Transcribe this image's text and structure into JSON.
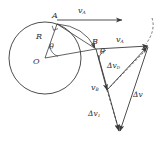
{
  "figure": {
    "stroke_color": "#3a3a3a",
    "label_color": "#2b2b2b",
    "background": "#ffffff"
  },
  "geometry": {
    "circle": {
      "cx": 45,
      "cy": 58,
      "r": 36
    },
    "points": {
      "A": {
        "x": 57,
        "y": 24
      },
      "B": {
        "x": 96,
        "y": 49
      },
      "O": {
        "x": 45,
        "y": 58
      },
      "vA_tip": {
        "x": 148,
        "y": 46
      },
      "vB_tip": {
        "x": 107,
        "y": 90
      },
      "dv1_tip": {
        "x": 119,
        "y": 130
      }
    }
  },
  "labels": {
    "point_A": "A",
    "point_B": "B",
    "point_O": "O",
    "radius": "R",
    "theta_center": "θ",
    "theta_at_B": "θ",
    "velocity_A_top": {
      "base": "v",
      "sub": "A"
    },
    "velocity_A_vec": {
      "base": "v",
      "sub": "A"
    },
    "velocity_B_vec": {
      "base": "v",
      "sub": "B"
    },
    "delta_v_D": {
      "base": "Δv",
      "sub": "D"
    },
    "delta_v_1": {
      "base": "Δv",
      "sub": "1"
    },
    "delta_v": {
      "base": "Δv",
      "sub": ""
    }
  },
  "label_text": {
    "point_A": "A",
    "point_B": "B",
    "point_O": "O",
    "radius": "R",
    "theta_center": "θ",
    "theta_at_B": "θ",
    "vA_top_base": "v",
    "vA_top_sub": "A",
    "vA_vec_base": "v",
    "vA_vec_sub": "A",
    "vB_vec_base": "v",
    "vB_vec_sub": "B",
    "dvD_base": "Δv",
    "dvD_sub": "D",
    "dv1_base": "Δv",
    "dv1_sub": "1",
    "dv_base": "Δv",
    "dv_sub": ""
  }
}
